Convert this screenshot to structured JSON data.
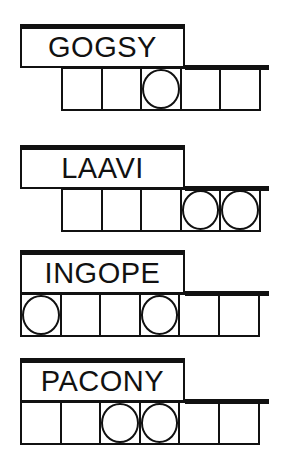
{
  "puzzles": [
    {
      "scrambled": "GOGSY",
      "letters": 5,
      "circled": [
        3
      ]
    },
    {
      "scrambled": "LAAVI",
      "letters": 5,
      "circled": [
        4,
        5
      ]
    },
    {
      "scrambled": "INGOPE",
      "letters": 6,
      "circled": [
        1,
        4
      ]
    },
    {
      "scrambled": "PACONY",
      "letters": 6,
      "circled": [
        3,
        4
      ]
    }
  ],
  "colors": {
    "ink": "#111111",
    "background": "#ffffff"
  }
}
